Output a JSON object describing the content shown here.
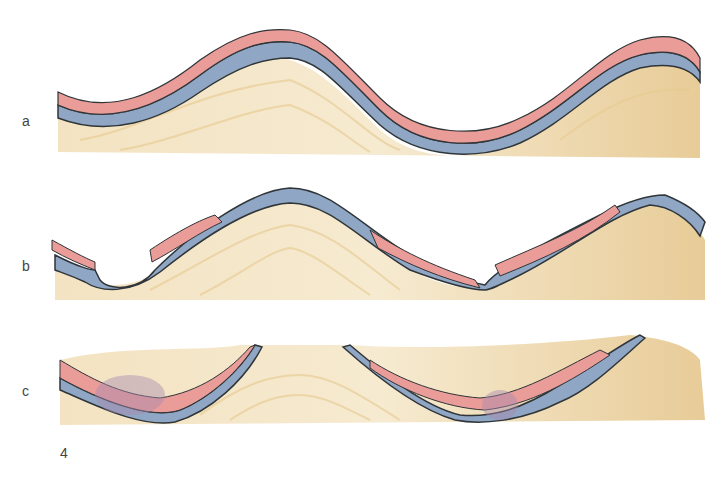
{
  "figure": {
    "number": "4",
    "panels": [
      {
        "label": "a",
        "description": "folded strata: anticline and syncline with intact layers"
      },
      {
        "label": "b",
        "description": "eroded folds: upper layers removed at crests and in valley"
      },
      {
        "label": "c",
        "description": "deeply eroded folds: only synclinal remnants of layers preserved"
      }
    ]
  },
  "colors": {
    "sand": "#ecd4a4",
    "blue_layer": "#8fa6c4",
    "pink_layer": "#ea9c98",
    "outline": "#333a40"
  }
}
